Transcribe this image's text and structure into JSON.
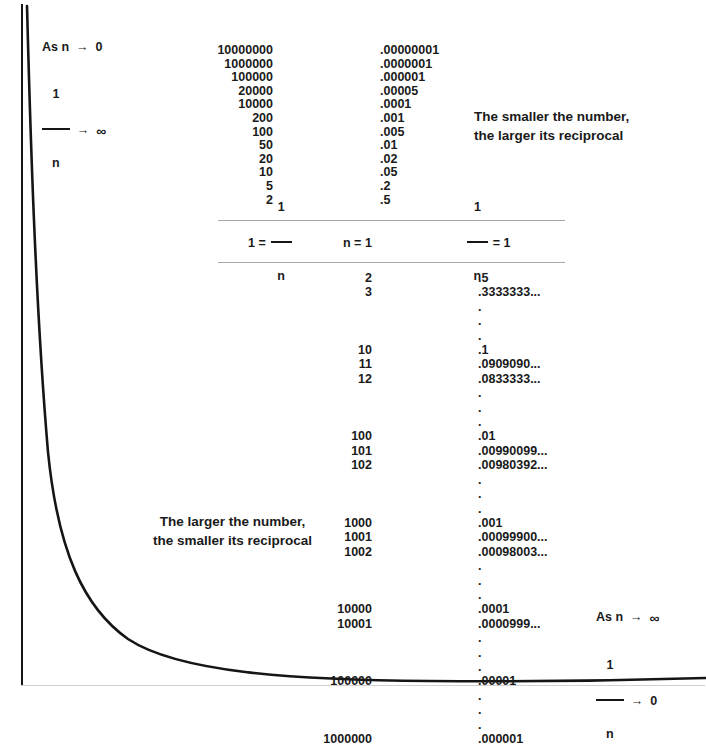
{
  "page": {
    "background_color": "#ffffff",
    "ink_color": "#151515",
    "rule_color": "#a8a8a8"
  },
  "limits": {
    "top_left": {
      "line1_prefix": "As n",
      "line1_arrow": "→",
      "line1_value": "0",
      "line2_numerator": "1",
      "line2_denominator": "n",
      "line2_arrow": "→",
      "line2_value": "∞"
    },
    "bottom_right": {
      "line1_prefix": "As n",
      "line1_arrow": "→",
      "line1_value": "∞",
      "line2_numerator": "1",
      "line2_denominator": "n",
      "line2_arrow": "→",
      "line2_value": "0"
    }
  },
  "captions": {
    "right": "The smaller the number,\nthe larger its reciprocal",
    "left": "The larger the number,\nthe smaller its reciprocal"
  },
  "equation_band": {
    "left": {
      "lead": "1 =",
      "numerator": "1",
      "denominator": "n"
    },
    "middle": "n = 1",
    "right": {
      "numerator": "1",
      "denominator": "n",
      "trail": "= 1"
    }
  },
  "chart_data": {
    "type": "line",
    "xlabel": "n",
    "ylabel": "1/n",
    "grid": false,
    "legend": null,
    "curve_description": "Rectangular hyperbola y = 1/n descending steeply from upper-left asymptote toward lower-right horizontal asymptote",
    "x": [
      0.06,
      0.07,
      0.09,
      0.12,
      0.17,
      0.25,
      0.4,
      0.62,
      1.0,
      1.6,
      2.6,
      4.3,
      7.0
    ],
    "y": [
      16.7,
      14.3,
      11.1,
      8.3,
      5.9,
      4.0,
      2.5,
      1.6,
      1.0,
      0.62,
      0.38,
      0.23,
      0.14
    ],
    "table_top": {
      "header_n": "n",
      "header_recip": "1/n",
      "n_values": [
        "10000000",
        "1000000",
        "100000",
        "20000",
        "10000",
        "200",
        "100",
        "50",
        "20",
        "10",
        "5",
        "2"
      ],
      "reciprocals": [
        ".00000001",
        ".0000001",
        ".000001",
        ".00005",
        ".0001",
        ".001",
        ".005",
        ".01",
        ".02",
        ".05",
        ".2",
        ".5"
      ]
    },
    "table_bottom": {
      "rows": [
        {
          "n": "2",
          "recip": ".5"
        },
        {
          "n": "3",
          "recip": ".3333333..."
        },
        {
          "n": "",
          "recip": "."
        },
        {
          "n": "",
          "recip": "."
        },
        {
          "n": "",
          "recip": "."
        },
        {
          "n": "10",
          "recip": ".1"
        },
        {
          "n": "11",
          "recip": ".0909090..."
        },
        {
          "n": "12",
          "recip": ".0833333..."
        },
        {
          "n": "",
          "recip": "."
        },
        {
          "n": "",
          "recip": "."
        },
        {
          "n": "",
          "recip": "."
        },
        {
          "n": "100",
          "recip": ".01"
        },
        {
          "n": "101",
          "recip": ".00990099..."
        },
        {
          "n": "102",
          "recip": ".00980392..."
        },
        {
          "n": "",
          "recip": "."
        },
        {
          "n": "",
          "recip": "."
        },
        {
          "n": "",
          "recip": "."
        },
        {
          "n": "1000",
          "recip": ".001"
        },
        {
          "n": "1001",
          "recip": ".00099900..."
        },
        {
          "n": "1002",
          "recip": ".00098003..."
        },
        {
          "n": "",
          "recip": "."
        },
        {
          "n": "",
          "recip": "."
        },
        {
          "n": "",
          "recip": "."
        },
        {
          "n": "10000",
          "recip": ".0001"
        },
        {
          "n": "10001",
          "recip": ".0000999..."
        },
        {
          "n": "",
          "recip": "."
        },
        {
          "n": "",
          "recip": "."
        },
        {
          "n": "",
          "recip": "."
        },
        {
          "n": "100000",
          "recip": ".00001"
        },
        {
          "n": "",
          "recip": "."
        },
        {
          "n": "",
          "recip": "."
        },
        {
          "n": "",
          "recip": "."
        },
        {
          "n": "1000000",
          "recip": ".000001"
        }
      ]
    }
  }
}
